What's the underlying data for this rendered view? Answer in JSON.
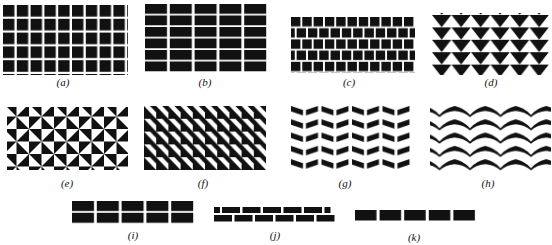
{
  "figure": {
    "ink_color": "#111111",
    "background": "#ffffff",
    "panels": [
      {
        "id": "a",
        "label": "(a)",
        "description": "grid of squares, 9 columns x 5 rows"
      },
      {
        "id": "b",
        "label": "(b)",
        "description": "grid of wide rectangles, 5 columns x 6 rows"
      },
      {
        "id": "c",
        "label": "(c)",
        "description": "offset (running bond) rows of squares, 5 rows"
      },
      {
        "id": "d",
        "label": "(d)",
        "description": "tessellation of alternating black and white triangles"
      },
      {
        "id": "e",
        "label": "(e)",
        "description": "pinwheel pattern of right triangles"
      },
      {
        "id": "f",
        "label": "(f)",
        "description": "checker pattern of half-square triangles"
      },
      {
        "id": "g",
        "label": "(g)",
        "description": "chevron (herringbone) strokes, 5 rows"
      },
      {
        "id": "h",
        "label": "(h)",
        "description": "arched chevrons / wave shapes, 5 rows"
      },
      {
        "id": "i",
        "label": "(i)",
        "description": "two aligned rows of 5 rectangles"
      },
      {
        "id": "j",
        "label": "(j)",
        "description": "two rows of bricks, top row offset by half a brick"
      },
      {
        "id": "k",
        "label": "(k)",
        "description": "single row of 5 rectangles"
      }
    ]
  }
}
